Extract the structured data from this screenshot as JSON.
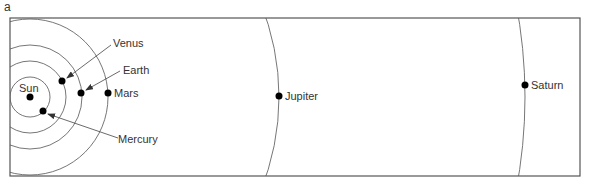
{
  "figure": {
    "panel_label": "a",
    "frame": {
      "x": 10,
      "y": 18,
      "width": 570,
      "height": 158
    },
    "colors": {
      "line": "#555555",
      "dot": "#000000",
      "text": "#333333",
      "background": "#ffffff"
    }
  },
  "sun": {
    "label": "Sun",
    "cx": 30,
    "cy": 97
  },
  "orbits": [
    {
      "name": "Mercury",
      "r": 20
    },
    {
      "name": "Venus",
      "r": 36
    },
    {
      "name": "Earth",
      "r": 52
    },
    {
      "name": "Mars",
      "r": 78
    },
    {
      "name": "Jupiter",
      "r": 249
    },
    {
      "name": "Saturn",
      "r": 495
    }
  ],
  "planets": [
    {
      "name": "Mercury",
      "label": "Mercury",
      "cx": 43,
      "cy": 111
    },
    {
      "name": "Venus",
      "label": "Venus",
      "cx": 62,
      "cy": 81
    },
    {
      "name": "Earth",
      "label": "Earth",
      "cx": 81,
      "cy": 93
    },
    {
      "name": "Mars",
      "label": "Mars",
      "cx": 108,
      "cy": 93
    },
    {
      "name": "Jupiter",
      "label": "Jupiter",
      "cx": 279,
      "cy": 96
    },
    {
      "name": "Saturn",
      "label": "Saturn",
      "cx": 525,
      "cy": 85
    }
  ]
}
